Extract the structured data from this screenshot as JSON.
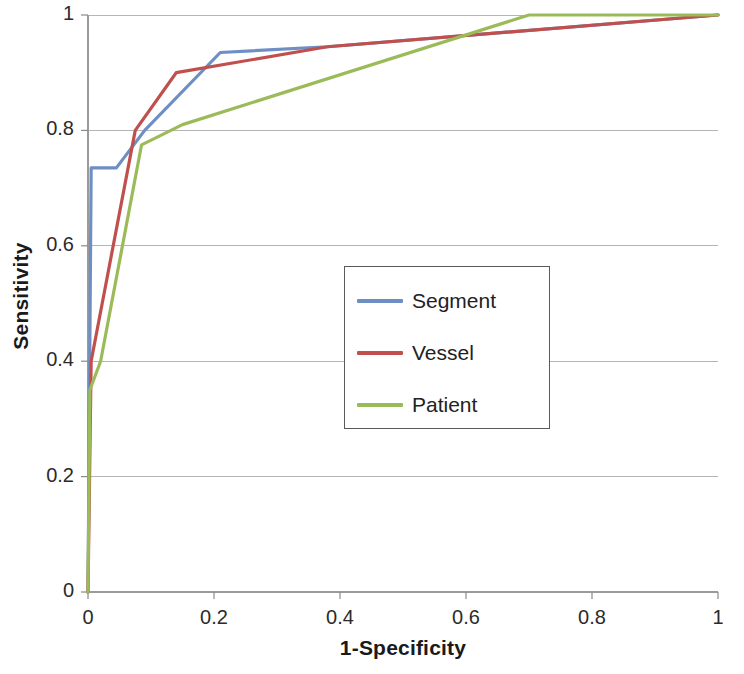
{
  "chart_data": {
    "type": "line",
    "title": "",
    "xlabel": "1-Specificity",
    "ylabel": "Sensitivity",
    "xlim": [
      0,
      1
    ],
    "ylim": [
      0,
      1
    ],
    "xticks": [
      "0",
      "0.2",
      "0.4",
      "0.6",
      "0.8",
      "1"
    ],
    "yticks": [
      "0",
      "0.2",
      "0.4",
      "0.6",
      "0.8",
      "1"
    ],
    "xtick_values": [
      0,
      0.2,
      0.4,
      0.6,
      0.8,
      1
    ],
    "ytick_values": [
      0,
      0.2,
      0.4,
      0.6,
      0.8,
      1
    ],
    "grid": "horizontal",
    "legend_position": "center",
    "series": [
      {
        "name": "Segment",
        "color": "#6E8FC4",
        "x": [
          0,
          0.005,
          0.045,
          0.09,
          0.21,
          0.38,
          1
        ],
        "y": [
          0,
          0.735,
          0.735,
          0.8,
          0.935,
          0.945,
          1
        ]
      },
      {
        "name": "Vessel",
        "color": "#C0504D",
        "x": [
          0,
          0.005,
          0.075,
          0.14,
          0.38,
          1
        ],
        "y": [
          0,
          0.4,
          0.8,
          0.9,
          0.945,
          1
        ]
      },
      {
        "name": "Patient",
        "color": "#9BBB59",
        "x": [
          0,
          0.003,
          0.02,
          0.085,
          0.15,
          0.7,
          1
        ],
        "y": [
          0,
          0.35,
          0.4,
          0.775,
          0.81,
          1.0,
          1.0
        ]
      }
    ]
  },
  "legend": {
    "items": [
      {
        "label": "Segment",
        "color": "#6E8FC4"
      },
      {
        "label": "Vessel",
        "color": "#C0504D"
      },
      {
        "label": "Patient",
        "color": "#9BBB59"
      }
    ]
  },
  "axes": {
    "x_title": "1-Specificity",
    "y_title": "Sensitivity"
  }
}
